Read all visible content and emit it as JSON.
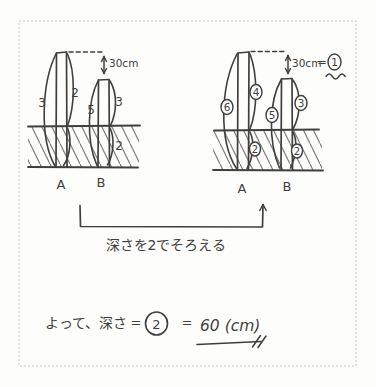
{
  "colors": {
    "ink": "#3f3f3f",
    "hatch": "#707070",
    "border": "#c6c6c6"
  },
  "diagram": {
    "left": {
      "a_total": "3",
      "a_above": "2",
      "b_total": "5",
      "b_above": "3",
      "b_below": "2",
      "gap": "30cm",
      "pole_a": "A",
      "pole_b": "B"
    },
    "right": {
      "a_total": "6",
      "a_above": "4",
      "a_below": "2",
      "b_total": "5",
      "b_above": "3",
      "b_below": "2",
      "gap": "30cm",
      "equals": "=",
      "unit": "1",
      "pole_a": "A",
      "pole_b": "B"
    }
  },
  "note": "深さを2でそろえる",
  "conclusion": {
    "lead": "よって、深さ",
    "eq1": "=",
    "circled": "2",
    "eq2": "=",
    "answer": "60 (cm)"
  }
}
